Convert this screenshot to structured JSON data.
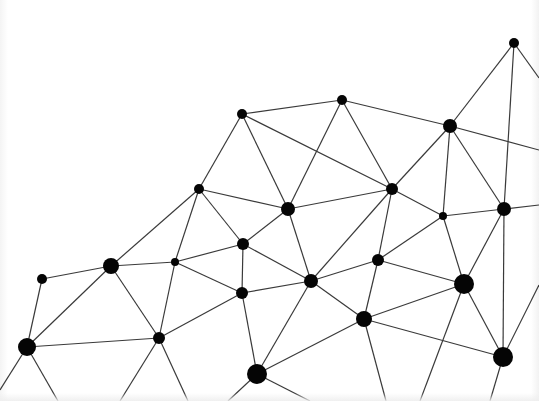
{
  "diagram": {
    "type": "network-graph",
    "width": 539,
    "height": 401,
    "colors": {
      "background": "#ffffff",
      "node": "#050505",
      "edge": "#3a3a3a"
    },
    "nodes": [
      {
        "id": "n1",
        "x": 514,
        "y": 43,
        "r": 5
      },
      {
        "id": "n2",
        "x": 342,
        "y": 100,
        "r": 5
      },
      {
        "id": "n3",
        "x": 242,
        "y": 114,
        "r": 5
      },
      {
        "id": "n4",
        "x": 450,
        "y": 126,
        "r": 7
      },
      {
        "id": "n5",
        "x": 199,
        "y": 189,
        "r": 5
      },
      {
        "id": "n6",
        "x": 392,
        "y": 189,
        "r": 6
      },
      {
        "id": "n7",
        "x": 288,
        "y": 209,
        "r": 7
      },
      {
        "id": "n8",
        "x": 443,
        "y": 216,
        "r": 4
      },
      {
        "id": "n9",
        "x": 504,
        "y": 209,
        "r": 7
      },
      {
        "id": "n10",
        "x": 243,
        "y": 244,
        "r": 6
      },
      {
        "id": "n11",
        "x": 175,
        "y": 262,
        "r": 4
      },
      {
        "id": "n12",
        "x": 111,
        "y": 266,
        "r": 8
      },
      {
        "id": "n13",
        "x": 42,
        "y": 279,
        "r": 5
      },
      {
        "id": "n14",
        "x": 378,
        "y": 260,
        "r": 6
      },
      {
        "id": "n15",
        "x": 311,
        "y": 281,
        "r": 7
      },
      {
        "id": "n16",
        "x": 464,
        "y": 284,
        "r": 10
      },
      {
        "id": "n17",
        "x": 242,
        "y": 293,
        "r": 6
      },
      {
        "id": "n18",
        "x": 364,
        "y": 319,
        "r": 8
      },
      {
        "id": "n19",
        "x": 159,
        "y": 338,
        "r": 6
      },
      {
        "id": "n20",
        "x": 27,
        "y": 347,
        "r": 9
      },
      {
        "id": "n21",
        "x": 503,
        "y": 357,
        "r": 10
      },
      {
        "id": "n22",
        "x": 257,
        "y": 374,
        "r": 10
      }
    ],
    "edges": [
      [
        "n3",
        "n2"
      ],
      [
        "n3",
        "n6"
      ],
      [
        "n3",
        "n7"
      ],
      [
        "n3",
        "n5"
      ],
      [
        "n2",
        "n7"
      ],
      [
        "n2",
        "n6"
      ],
      [
        "n2",
        "n4"
      ],
      [
        "n4",
        "n1"
      ],
      [
        "n4",
        "n6"
      ],
      [
        "n4",
        "n8"
      ],
      [
        "n4",
        "n9"
      ],
      [
        "n4",
        "x:539,150"
      ],
      [
        "n1",
        "n9"
      ],
      [
        "n1",
        "x:539,78"
      ],
      [
        "n5",
        "n7"
      ],
      [
        "n5",
        "n10"
      ],
      [
        "n5",
        "n12"
      ],
      [
        "n5",
        "n11"
      ],
      [
        "n7",
        "n6"
      ],
      [
        "n7",
        "n10"
      ],
      [
        "n7",
        "n15"
      ],
      [
        "n6",
        "n8"
      ],
      [
        "n6",
        "n15"
      ],
      [
        "n6",
        "n14"
      ],
      [
        "n8",
        "n9"
      ],
      [
        "n8",
        "n14"
      ],
      [
        "n8",
        "n16"
      ],
      [
        "n9",
        "n16"
      ],
      [
        "n9",
        "n21"
      ],
      [
        "n9",
        "x:539,205"
      ],
      [
        "n10",
        "n11"
      ],
      [
        "n10",
        "n17"
      ],
      [
        "n10",
        "n15"
      ],
      [
        "n11",
        "n12"
      ],
      [
        "n11",
        "n17"
      ],
      [
        "n11",
        "n19"
      ],
      [
        "n12",
        "n13"
      ],
      [
        "n12",
        "n19"
      ],
      [
        "n12",
        "n20"
      ],
      [
        "n13",
        "n20"
      ],
      [
        "n14",
        "n15"
      ],
      [
        "n14",
        "n16"
      ],
      [
        "n14",
        "n18"
      ],
      [
        "n15",
        "n17"
      ],
      [
        "n15",
        "n18"
      ],
      [
        "n15",
        "n22"
      ],
      [
        "n16",
        "n18"
      ],
      [
        "n16",
        "n21"
      ],
      [
        "n16",
        "x:420,401"
      ],
      [
        "n17",
        "n19"
      ],
      [
        "n17",
        "n22"
      ],
      [
        "n18",
        "n21"
      ],
      [
        "n18",
        "n22"
      ],
      [
        "n18",
        "x:386,401"
      ],
      [
        "n19",
        "n20"
      ],
      [
        "n19",
        "x:120,401"
      ],
      [
        "n19",
        "x:188,401"
      ],
      [
        "n20",
        "x:0,390"
      ],
      [
        "n20",
        "x:58,401"
      ],
      [
        "n21",
        "x:539,285"
      ],
      [
        "n21",
        "x:490,401"
      ],
      [
        "n22",
        "x:228,401"
      ],
      [
        "n22",
        "x:310,401"
      ]
    ]
  }
}
